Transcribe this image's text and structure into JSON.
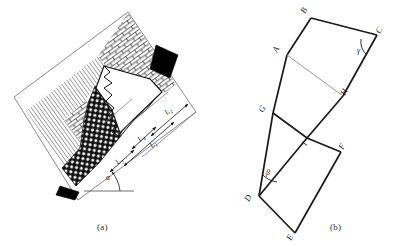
{
  "figure": {
    "panels": [
      {
        "id": "a",
        "caption": "(a)",
        "name": "schematic-cross-section",
        "angle_label": "α",
        "dimension_labels": [
          "L₁",
          "L₂",
          "L₃",
          "L₄"
        ],
        "dimensions": [
          {
            "label": "L",
            "sub": "1",
            "name": "dimension-L1"
          },
          {
            "label": "L",
            "sub": "2",
            "name": "dimension-L2"
          },
          {
            "label": "L",
            "sub": "3",
            "name": "dimension-L3"
          },
          {
            "label": "L",
            "sub": "4",
            "name": "dimension-L4"
          }
        ],
        "regions": [
          {
            "name": "brick-hatch-zone",
            "fill": "brick"
          },
          {
            "name": "diagonal-hatch-zone",
            "fill": "diagonal-lines"
          },
          {
            "name": "stipple-gravel-zone",
            "fill": "circles"
          },
          {
            "name": "black-block-upper",
            "fill": "solid-black"
          },
          {
            "name": "black-block-lower",
            "fill": "solid-black"
          },
          {
            "name": "white-cavity-zone",
            "fill": "white"
          }
        ]
      },
      {
        "id": "b",
        "caption": "(b)",
        "name": "geometric-construction",
        "vertices": [
          {
            "label": "A",
            "x": 287,
            "y": 55
          },
          {
            "label": "B",
            "x": 311,
            "y": 18
          },
          {
            "label": "C",
            "x": 377,
            "y": 35
          },
          {
            "label": "D",
            "x": 259,
            "y": 196
          },
          {
            "label": "E",
            "x": 295,
            "y": 233
          },
          {
            "label": "F",
            "x": 341,
            "y": 152
          },
          {
            "label": "G",
            "x": 273,
            "y": 113
          },
          {
            "label": "H",
            "x": 343,
            "y": 96
          },
          {
            "label": "I",
            "x": 307,
            "y": 138
          }
        ],
        "angles": [
          {
            "label": "γ",
            "at": "C",
            "name": "angle-gamma"
          },
          {
            "label": "β",
            "at": "D",
            "name": "angle-beta"
          }
        ]
      }
    ]
  },
  "colors": {
    "ink": "#1a1a1a",
    "frame": "#5a5a5a",
    "thin": "#8a8a8a",
    "black_fill": "#000000"
  }
}
